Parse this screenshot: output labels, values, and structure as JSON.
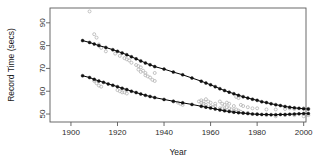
{
  "chart_data": {
    "type": "scatter",
    "title": "",
    "subtitle": "",
    "xlabel": "Year",
    "ylabel": "Record Time (secs)",
    "xlim": [
      1891,
      2001
    ],
    "ylim": [
      46.5,
      96.5
    ],
    "xticks": [
      1900,
      1920,
      1940,
      1960,
      1980,
      2000
    ],
    "xticklabels": [
      "1900",
      "1920",
      "1940",
      "1960",
      "1980",
      "2000"
    ],
    "yticks": [
      50,
      60,
      70,
      80,
      90
    ],
    "yticklabels": [
      "50",
      "60",
      "70",
      "80",
      "90"
    ],
    "grid": false,
    "legend": null,
    "box": true,
    "colors": {
      "fitted_points": "#111111",
      "fitted_line": "#000000",
      "raw_points": "#b4b4b4",
      "axis": "#5a5a5a",
      "background": "#ffffff",
      "text": "#222222"
    },
    "series": [
      {
        "name": "Women record progression (fitted)",
        "marker": "filled-circle",
        "color": "#111111",
        "line": true,
        "x": [
          1905,
          1908,
          1910,
          1912,
          1915,
          1918,
          1920,
          1922,
          1924,
          1926,
          1928,
          1930,
          1932,
          1934,
          1936,
          1940,
          1944,
          1948,
          1952,
          1956,
          1958,
          1960,
          1962,
          1964,
          1966,
          1968,
          1970,
          1972,
          1974,
          1976,
          1978,
          1980,
          1982,
          1984,
          1986,
          1988,
          1990,
          1992,
          1994,
          1996,
          1998,
          2000,
          2002
        ],
        "y": [
          82.2,
          81.4,
          80.7,
          80.0,
          79.2,
          78.2,
          77.5,
          76.8,
          76.0,
          75.1,
          74.2,
          73.3,
          72.4,
          71.6,
          70.8,
          69.7,
          68.4,
          67.2,
          65.8,
          64.4,
          63.6,
          62.8,
          62.0,
          61.1,
          60.3,
          59.6,
          58.9,
          58.2,
          57.6,
          57.0,
          56.5,
          56.0,
          55.4,
          55.0,
          54.5,
          54.1,
          53.7,
          53.3,
          53.0,
          52.7,
          52.5,
          52.3,
          52.2
        ]
      },
      {
        "name": "Men record progression (fitted)",
        "marker": "filled-circle",
        "color": "#111111",
        "line": true,
        "x": [
          1905,
          1908,
          1910,
          1912,
          1914,
          1916,
          1918,
          1920,
          1922,
          1924,
          1926,
          1928,
          1930,
          1932,
          1934,
          1936,
          1940,
          1944,
          1948,
          1952,
          1956,
          1958,
          1960,
          1962,
          1964,
          1966,
          1968,
          1970,
          1972,
          1974,
          1976,
          1978,
          1980,
          1982,
          1984,
          1986,
          1988,
          1990,
          1992,
          1994,
          1996,
          1998,
          2000,
          2002
        ],
        "y": [
          66.8,
          66.0,
          65.2,
          64.5,
          63.9,
          63.2,
          62.6,
          62.0,
          61.3,
          60.7,
          60.0,
          59.4,
          58.8,
          58.2,
          57.7,
          57.2,
          56.4,
          55.6,
          54.9,
          54.2,
          53.4,
          53.0,
          52.6,
          52.2,
          51.8,
          51.4,
          51.1,
          50.8,
          50.6,
          50.4,
          50.2,
          50.0,
          49.9,
          49.8,
          49.8,
          49.7,
          49.7,
          49.8,
          49.8,
          49.9,
          50.0,
          50.1,
          50.2,
          50.2
        ]
      },
      {
        "name": "Individual records (raw, upper group)",
        "marker": "open-circle",
        "color": "#b4b4b4",
        "line": false,
        "x": [
          1908,
          1910,
          1911,
          1912,
          1913,
          1915,
          1919,
          1921,
          1923,
          1924,
          1925,
          1926,
          1928,
          1929,
          1929,
          1930,
          1930,
          1931,
          1932,
          1932,
          1933,
          1934,
          1935,
          1936,
          1936,
          1956,
          1957,
          1958,
          1959,
          1960,
          1962,
          1964,
          1965,
          1966,
          1967,
          1968,
          1970,
          1971,
          1972,
          1973,
          1974,
          1976,
          1978,
          1980,
          1984,
          1988,
          1992,
          1994,
          1996,
          2000,
          2002
        ],
        "y": [
          95.0,
          85.0,
          83.5,
          80.5,
          79.0,
          77.5,
          76.5,
          75.5,
          74.5,
          74.0,
          73.5,
          72.5,
          71.5,
          71.0,
          69.5,
          70.5,
          68.5,
          69.0,
          68.0,
          67.0,
          66.5,
          66.0,
          65.0,
          68.0,
          64.5,
          56.0,
          55.5,
          56.5,
          55.5,
          55.0,
          54.5,
          55.5,
          54.5,
          54.0,
          55.0,
          54.5,
          53.5,
          57.5,
          57.0,
          54.0,
          53.5,
          53.0,
          52.5,
          52.5,
          52.0,
          52.0,
          52.2,
          52.5,
          52.2,
          52.5,
          52.3
        ]
      },
      {
        "name": "Individual records (raw, lower group)",
        "marker": "open-circle",
        "color": "#b4b4b4",
        "line": false,
        "x": [
          1910,
          1911,
          1912,
          1913,
          1920,
          1921,
          1922,
          1923,
          1924,
          1944,
          1946,
          1947,
          1948,
          1955,
          1956,
          1957,
          1958,
          1960,
          1961,
          1962,
          1964,
          1965,
          1966,
          1967,
          1968,
          1969,
          1970,
          1971,
          1972,
          1973,
          1974,
          1976,
          1980,
          1984,
          1988,
          1992,
          1996,
          2000,
          2002
        ],
        "y": [
          64.5,
          63.5,
          62.5,
          62.0,
          60.5,
          60.0,
          59.5,
          59.5,
          59.0,
          55.5,
          55.0,
          54.5,
          54.0,
          55.5,
          55.0,
          54.5,
          54.0,
          53.5,
          53.0,
          53.5,
          52.5,
          52.5,
          52.0,
          53.0,
          52.5,
          52.0,
          51.5,
          52.0,
          51.5,
          51.0,
          50.5,
          50.5,
          50.0,
          49.5,
          49.0,
          49.5,
          49.5,
          49.0,
          49.5
        ]
      }
    ]
  }
}
